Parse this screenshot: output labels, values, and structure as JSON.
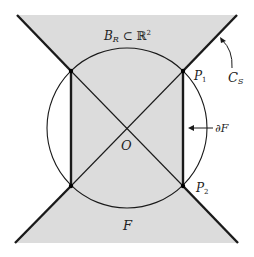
{
  "diagram": {
    "colors": {
      "shade": "#dcdcdc",
      "line": "#1a1a1a",
      "background": "#ffffff"
    },
    "labels": {
      "ball": "B",
      "ball_sub": "R",
      "ball_rel": " ⊂ ℝ",
      "ball_sup": "2",
      "p1": "P",
      "p1_sub": "1",
      "p2": "P",
      "p2_sub": "2",
      "cs": "C",
      "cs_sub": "S",
      "origin": "O",
      "boundary": "∂F",
      "region": "F"
    }
  }
}
